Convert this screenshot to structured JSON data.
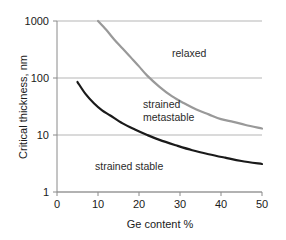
{
  "chart_data": {
    "type": "line",
    "title": "",
    "xlabel": "Ge content %",
    "ylabel": "Critical thickness, nm",
    "xlim": [
      0,
      50
    ],
    "ylim": [
      1,
      1000
    ],
    "yscale": "log",
    "xscale": "linear",
    "grid": "horizontal-only",
    "legend": "none",
    "xticks": [
      "0",
      "10",
      "20",
      "30",
      "40",
      "50"
    ],
    "xtick_values": [
      0,
      10,
      20,
      30,
      40,
      50
    ],
    "yticks": [
      "1",
      "10",
      "100",
      "1000"
    ],
    "ytick_values": [
      1,
      10,
      100,
      1000
    ],
    "series": [
      {
        "name": "relaxed boundary",
        "color": "#999999",
        "x": [
          10,
          12,
          14,
          16,
          18,
          20,
          22,
          25,
          28,
          31,
          34,
          37,
          40,
          43,
          46,
          50
        ],
        "values": [
          1000,
          700,
          470,
          330,
          230,
          160,
          110,
          70,
          48,
          36,
          28,
          23,
          19,
          17,
          15,
          13
        ]
      },
      {
        "name": "strained stable boundary",
        "color": "#1a1a1a",
        "x": [
          5,
          7,
          9,
          11,
          13,
          16,
          19,
          22,
          25,
          29,
          33,
          37,
          41,
          45,
          50
        ],
        "values": [
          85,
          52,
          36,
          27,
          22,
          16,
          12.5,
          10,
          8.2,
          6.6,
          5.4,
          4.6,
          4.0,
          3.5,
          3.1
        ]
      }
    ],
    "annotations": [
      {
        "name": "relaxed",
        "text": "relaxed",
        "x": 32,
        "y": 300
      },
      {
        "name": "strained-metastable",
        "text": "strained",
        "text2": "metastable",
        "x": 30,
        "y": 30
      },
      {
        "name": "strained-stable",
        "text": "strained stable",
        "x": 20,
        "y": 3.4
      }
    ]
  },
  "axes": {
    "y_title": "Critical thickness, nm",
    "x_title": "Ge content %",
    "ytick_labels": [
      "1000",
      "100",
      "10",
      "1"
    ],
    "xtick_labels": [
      "0",
      "10",
      "20",
      "30",
      "40",
      "50"
    ]
  },
  "labels": {
    "relaxed": "relaxed",
    "strained_line1": "strained",
    "strained_line2": "metastable",
    "strained_stable": "strained stable"
  },
  "colors": {
    "relaxed_curve": "#9a9a9a",
    "stable_curve": "#1a1a1a",
    "gridline": "#b5b5b5",
    "axis": "#8a8a8a",
    "text": "#1a1a1a",
    "background": "#ffffff"
  }
}
